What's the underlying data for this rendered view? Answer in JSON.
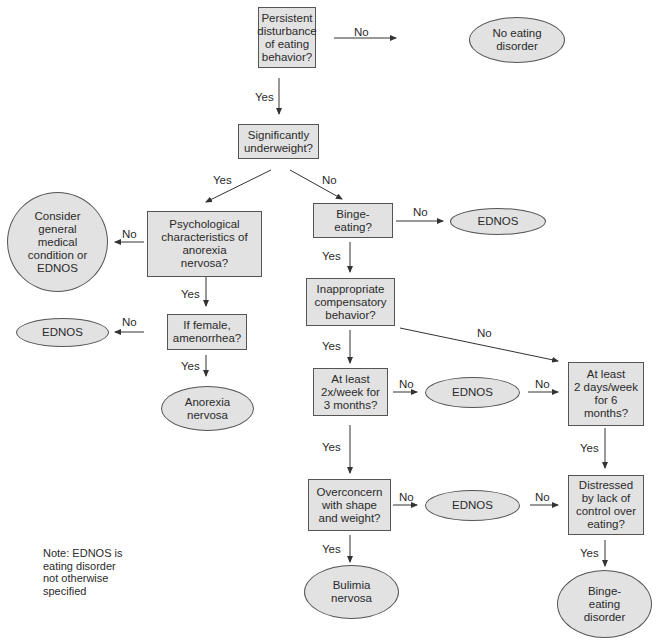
{
  "nodes": {
    "persistent": "Persistent\ndisturbance\nof eating\nbehavior?",
    "no_eating_disorder": "No eating\ndisorder",
    "underweight": "Significantly\nunderweight?",
    "psychological": "Psychological\ncharacteristics of\nanorexia\nnervosa?",
    "consider_general": "Consider\ngeneral\nmedical\ncondition or\nEDNOS",
    "amenorrhea": "If female,\namenorrhea?",
    "ednos_left": "EDNOS",
    "anorexia": "Anorexia\nnervosa",
    "binge_eating_q": "Binge-\neating?",
    "ednos_binge": "EDNOS",
    "compensatory": "Inappropriate\ncompensatory\nbehavior?",
    "twice_week": "At least\n2x/week for\n3 months?",
    "ednos_mid": "EDNOS",
    "two_days": "At least\n2 days/week\nfor 6\nmonths?",
    "overconcern": "Overconcern\nwith shape\nand weight?",
    "ednos_low": "EDNOS",
    "distressed": "Distressed\nby lack of\ncontrol over\neating?",
    "bulimia": "Bulimia\nnervosa",
    "binge_disorder": "Binge-\neating\ndisorder"
  },
  "edge_labels": {
    "yes": "Yes",
    "no": "No"
  },
  "note": "Note: EDNOS is\neating disorder\nnot otherwise\nspecified",
  "colors": {
    "node_fill": "#e2e2e2",
    "stroke": "#555555",
    "text": "#2a2a2a"
  }
}
